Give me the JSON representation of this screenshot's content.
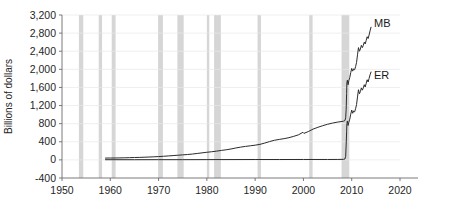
{
  "chart_data": {
    "type": "line",
    "title": "",
    "subtitle": "",
    "xlabel": "",
    "ylabel": "Billions of dollars",
    "xlim": [
      1950,
      2020
    ],
    "ylim": [
      -400,
      3200
    ],
    "grid": true,
    "legend_position": "inline-right-end-labels",
    "x_ticks": [
      1950,
      1960,
      1970,
      1980,
      1990,
      2000,
      2010,
      2020
    ],
    "x_tick_labels": [
      "1950",
      "1960",
      "1970",
      "1980",
      "1990",
      "2000",
      "2010",
      "2020"
    ],
    "y_ticks": [
      -400,
      0,
      400,
      800,
      1200,
      1600,
      2000,
      2400,
      2800,
      3200
    ],
    "y_tick_labels": [
      "-400",
      "0",
      "400",
      "800",
      "1,200",
      "1,600",
      "2,000",
      "2,400",
      "2,800",
      "3,200"
    ],
    "series": [
      {
        "name": "MB",
        "label": "MB",
        "label_x": 2014.2,
        "label_y": 3020,
        "color": "#2b2b2b",
        "points": [
          [
            1959.0,
            40
          ],
          [
            1960.0,
            41
          ],
          [
            1961.0,
            42
          ],
          [
            1962.0,
            44
          ],
          [
            1963.0,
            46
          ],
          [
            1964.0,
            49
          ],
          [
            1965.0,
            52
          ],
          [
            1966.0,
            55
          ],
          [
            1967.0,
            59
          ],
          [
            1968.0,
            63
          ],
          [
            1969.0,
            68
          ],
          [
            1970.0,
            73
          ],
          [
            1971.0,
            80
          ],
          [
            1972.0,
            87
          ],
          [
            1973.0,
            95
          ],
          [
            1974.0,
            103
          ],
          [
            1975.0,
            111
          ],
          [
            1976.0,
            119
          ],
          [
            1977.0,
            129
          ],
          [
            1978.0,
            142
          ],
          [
            1979.0,
            155
          ],
          [
            1980.0,
            168
          ],
          [
            1981.0,
            180
          ],
          [
            1982.0,
            193
          ],
          [
            1983.0,
            209
          ],
          [
            1984.0,
            223
          ],
          [
            1985.0,
            241
          ],
          [
            1986.0,
            263
          ],
          [
            1987.0,
            282
          ],
          [
            1988.0,
            298
          ],
          [
            1989.0,
            311
          ],
          [
            1990.0,
            325
          ],
          [
            1991.0,
            343
          ],
          [
            1992.0,
            372
          ],
          [
            1993.0,
            405
          ],
          [
            1994.0,
            434
          ],
          [
            1995.0,
            452
          ],
          [
            1996.0,
            469
          ],
          [
            1997.0,
            491
          ],
          [
            1998.0,
            520
          ],
          [
            1999.0,
            555
          ],
          [
            1999.9,
            610
          ],
          [
            2000.1,
            585
          ],
          [
            2001.0,
            625
          ],
          [
            2002.0,
            680
          ],
          [
            2003.0,
            720
          ],
          [
            2004.0,
            755
          ],
          [
            2005.0,
            787
          ],
          [
            2006.0,
            812
          ],
          [
            2007.0,
            833
          ],
          [
            2008.3,
            855
          ],
          [
            2008.6,
            870
          ],
          [
            2008.75,
            930
          ],
          [
            2008.85,
            1120
          ],
          [
            2008.95,
            1470
          ],
          [
            2009.0,
            1700
          ],
          [
            2009.1,
            1760
          ],
          [
            2009.25,
            1660
          ],
          [
            2009.4,
            1750
          ],
          [
            2009.6,
            1820
          ],
          [
            2009.8,
            1930
          ],
          [
            2010.0,
            2020
          ],
          [
            2010.2,
            1960
          ],
          [
            2010.4,
            2010
          ],
          [
            2010.6,
            1990
          ],
          [
            2010.8,
            2060
          ],
          [
            2011.0,
            2150
          ],
          [
            2011.2,
            2320
          ],
          [
            2011.4,
            2480
          ],
          [
            2011.6,
            2400
          ],
          [
            2011.8,
            2450
          ],
          [
            2012.0,
            2530
          ],
          [
            2012.2,
            2480
          ],
          [
            2012.4,
            2530
          ],
          [
            2012.6,
            2600
          ],
          [
            2012.8,
            2560
          ],
          [
            2013.0,
            2640
          ],
          [
            2013.2,
            2720
          ],
          [
            2013.4,
            2680
          ],
          [
            2013.6,
            2760
          ],
          [
            2013.8,
            2850
          ],
          [
            2014.0,
            2930
          ]
        ]
      },
      {
        "name": "ER",
        "label": "ER",
        "label_x": 2014.2,
        "label_y": 1880,
        "color": "#2b2b2b",
        "points": [
          [
            1959.0,
            4
          ],
          [
            1965.0,
            4
          ],
          [
            1970.0,
            5
          ],
          [
            1975.0,
            5
          ],
          [
            1980.0,
            6
          ],
          [
            1985.0,
            7
          ],
          [
            1990.0,
            8
          ],
          [
            1995.0,
            8
          ],
          [
            2000.0,
            9
          ],
          [
            2005.0,
            9
          ],
          [
            2007.0,
            10
          ],
          [
            2008.3,
            12
          ],
          [
            2008.6,
            20
          ],
          [
            2008.75,
            80
          ],
          [
            2008.85,
            330
          ],
          [
            2008.95,
            620
          ],
          [
            2009.0,
            800
          ],
          [
            2009.1,
            860
          ],
          [
            2009.25,
            760
          ],
          [
            2009.4,
            830
          ],
          [
            2009.6,
            900
          ],
          [
            2009.8,
            1010
          ],
          [
            2010.0,
            1100
          ],
          [
            2010.2,
            1030
          ],
          [
            2010.4,
            1080
          ],
          [
            2010.6,
            1060
          ],
          [
            2010.8,
            1130
          ],
          [
            2011.0,
            1220
          ],
          [
            2011.2,
            1390
          ],
          [
            2011.4,
            1550
          ],
          [
            2011.6,
            1460
          ],
          [
            2011.8,
            1510
          ],
          [
            2012.0,
            1590
          ],
          [
            2012.2,
            1540
          ],
          [
            2012.4,
            1590
          ],
          [
            2012.6,
            1660
          ],
          [
            2012.8,
            1610
          ],
          [
            2013.0,
            1690
          ],
          [
            2013.2,
            1770
          ],
          [
            2013.4,
            1720
          ],
          [
            2013.6,
            1800
          ],
          [
            2013.8,
            1880
          ],
          [
            2014.0,
            1940
          ]
        ]
      }
    ],
    "recession_bands": [
      {
        "start": 1953.5,
        "end": 1954.4
      },
      {
        "start": 1957.6,
        "end": 1958.3
      },
      {
        "start": 1960.3,
        "end": 1961.1
      },
      {
        "start": 1969.9,
        "end": 1970.9
      },
      {
        "start": 1973.9,
        "end": 1975.2
      },
      {
        "start": 1980.0,
        "end": 1980.5
      },
      {
        "start": 1981.5,
        "end": 1982.9
      },
      {
        "start": 1990.5,
        "end": 1991.2
      },
      {
        "start": 2001.2,
        "end": 2001.9
      },
      {
        "start": 2007.9,
        "end": 2009.5
      }
    ],
    "colors": {
      "recession_band": "#d6d6d6",
      "gridline": "#e8e8e8",
      "axis": "#6b6b6b",
      "line": "#2b2b2b",
      "text": "#262626",
      "background": "#ffffff"
    }
  }
}
